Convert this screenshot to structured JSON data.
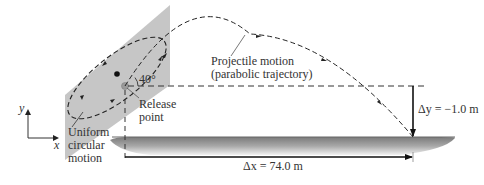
{
  "diagram": {
    "type": "physics-projectile",
    "labels": {
      "projectile_line1": "Projectile motion",
      "projectile_line2": "(parabolic trajectory)",
      "angle": "40°",
      "release_line1": "Release",
      "release_line2": "point",
      "uniform_line1": "Uniform",
      "uniform_line2": "circular",
      "uniform_line3": "motion",
      "axis_y": "y",
      "axis_x": "x",
      "delta_y": "Δy = −1.0 m",
      "delta_x": "Δx = 74.0 m"
    },
    "values": {
      "launch_angle_deg": 40,
      "delta_y_m": -1.0,
      "delta_x_m": 74.0
    },
    "colors": {
      "plane": "#c8c8c8",
      "ground": "#9a9a9a",
      "line": "#222222"
    }
  }
}
